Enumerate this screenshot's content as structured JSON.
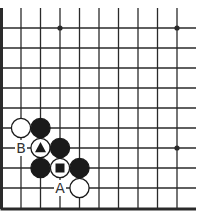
{
  "board": {
    "cols": 11,
    "rows": 10,
    "x0": 1.5,
    "y0": 28,
    "spacing_x": 19.5,
    "spacing_y": 20,
    "top_extension_y": 8,
    "right_extension_x": 196,
    "edges": {
      "left": "thick",
      "bottom": "thick",
      "top": "open",
      "right": "open"
    },
    "line_color": "#2a2a2a",
    "star_points": [
      {
        "col": 3,
        "row": 0
      },
      {
        "col": 9,
        "row": 0
      },
      {
        "col": 9,
        "row": 6
      }
    ]
  },
  "stones": [
    {
      "color": "white",
      "col": 1,
      "row": 5
    },
    {
      "color": "black",
      "col": 2,
      "row": 5
    },
    {
      "color": "white",
      "col": 2,
      "row": 6,
      "mark": "triangle"
    },
    {
      "color": "black",
      "col": 3,
      "row": 6
    },
    {
      "color": "black",
      "col": 2,
      "row": 7
    },
    {
      "color": "white",
      "col": 3,
      "row": 7,
      "mark": "square"
    },
    {
      "color": "black",
      "col": 4,
      "row": 7
    },
    {
      "color": "white",
      "col": 4,
      "row": 8
    }
  ],
  "labels": [
    {
      "text": "B",
      "col": 1,
      "row": 6
    },
    {
      "text": "A",
      "col": 3,
      "row": 8
    }
  ],
  "colors": {
    "black_stone": "#1a1a1a",
    "white_stone": "#ffffff",
    "stone_outline": "#1a1a1a",
    "label": "#333333"
  }
}
